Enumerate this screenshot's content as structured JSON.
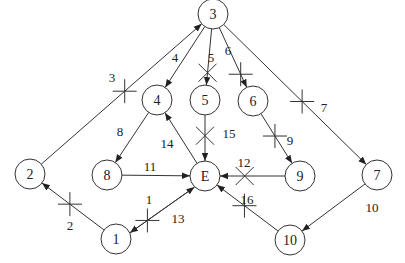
{
  "diagram": {
    "title": "",
    "node_radius": 15,
    "colors": {
      "stroke": "#333333",
      "text": "#222222",
      "background": "#ffffff"
    },
    "nodes": [
      {
        "id": "3",
        "label": "3",
        "x": 213,
        "y": 14
      },
      {
        "id": "4",
        "label": "4",
        "x": 157,
        "y": 100
      },
      {
        "id": "5",
        "label": "5",
        "x": 205,
        "y": 100
      },
      {
        "id": "6",
        "label": "6",
        "x": 253,
        "y": 101
      },
      {
        "id": "2",
        "label": "2",
        "x": 30,
        "y": 174
      },
      {
        "id": "8",
        "label": "8",
        "x": 107,
        "y": 175
      },
      {
        "id": "E",
        "label": "E",
        "x": 205,
        "y": 176
      },
      {
        "id": "9",
        "label": "9",
        "x": 300,
        "y": 176
      },
      {
        "id": "7",
        "label": "7",
        "x": 377,
        "y": 175
      },
      {
        "id": "1",
        "label": "1",
        "x": 116,
        "y": 239
      },
      {
        "id": "10",
        "label": "10",
        "x": 290,
        "y": 240
      }
    ],
    "edges": [
      {
        "from": "2",
        "to": "3",
        "label": "3",
        "label_x": 112,
        "label_y": 82,
        "cut": "cross",
        "cut_t": 0.52
      },
      {
        "from": "3",
        "to": "4",
        "label": "4",
        "label_x": 175,
        "label_y": 62,
        "cut": null
      },
      {
        "from": "3",
        "to": "5",
        "label": "5",
        "label_x": 211,
        "label_y": 62,
        "cut": "x",
        "cut_t": 0.78
      },
      {
        "from": "3",
        "to": "6",
        "label": "6",
        "label_x": 228,
        "label_y": 55,
        "cut": "cross",
        "cut_t": 0.78
      },
      {
        "from": "3",
        "to": "7",
        "label": "7",
        "label_x": 324,
        "label_y": 112,
        "cut": "cross",
        "cut_t": 0.55
      },
      {
        "from": "4",
        "to": "8",
        "label": "8",
        "label_x": 120,
        "label_y": 136,
        "cut": null
      },
      {
        "from": "6",
        "to": "9",
        "label": "9",
        "label_x": 290,
        "label_y": 145,
        "cut": "cross",
        "cut_t": 0.45
      },
      {
        "from": "5",
        "to": "E",
        "label": "15",
        "label_x": 229,
        "label_y": 138,
        "cut": "x",
        "cut_t": 0.45
      },
      {
        "from": "E",
        "to": "4",
        "label": "14",
        "label_x": 167,
        "label_y": 148,
        "cut": null
      },
      {
        "from": "8",
        "to": "E",
        "label": "11",
        "label_x": 150,
        "label_y": 171,
        "cut": null
      },
      {
        "from": "9",
        "to": "E",
        "label": "12",
        "label_x": 244,
        "label_y": 167,
        "cut": "x",
        "cut_t": 0.62
      },
      {
        "from": "7",
        "to": "10",
        "label": "10",
        "label_x": 372,
        "label_y": 212,
        "cut": null
      },
      {
        "from": "10",
        "to": "E",
        "label": "16",
        "label_x": 247,
        "label_y": 204,
        "cut": "cross",
        "cut_t": 0.55
      },
      {
        "from": "1",
        "to": "2",
        "label": "2",
        "label_x": 70,
        "label_y": 230,
        "cut": "cross",
        "cut_t": 0.55
      },
      {
        "from": "E",
        "to": "1",
        "label": "1",
        "label_x": 149,
        "label_y": 204,
        "cut": "cross",
        "cut_t": 0.73,
        "offset": -3
      },
      {
        "from": "1",
        "to": "E",
        "label": "13",
        "label_x": 178,
        "label_y": 223,
        "cut": null,
        "offset": 3
      }
    ]
  }
}
